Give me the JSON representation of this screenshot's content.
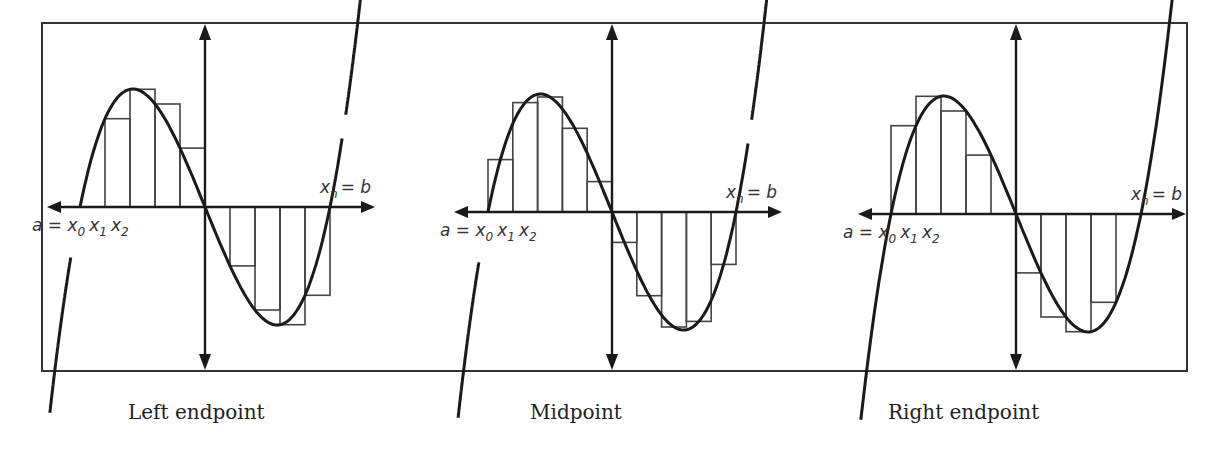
{
  "figure": {
    "panels": [
      {
        "id": "left",
        "caption": "Left endpoint",
        "method": "left",
        "origin": {
          "x": 205,
          "y": 207
        },
        "a_px": 80,
        "b_px": 332,
        "scale": {
          "sx": 84,
          "sy": 118
        },
        "label_a": "a = x",
        "label_x0_sub": "0",
        "label_x1": "x",
        "label_x1_sub": "1",
        "label_x2": "x",
        "label_x2_sub": "2",
        "label_b": "x",
        "label_b_sub": "n",
        "label_b_tail": "= b"
      },
      {
        "id": "mid",
        "caption": "Midpoint",
        "method": "mid",
        "origin": {
          "x": 612,
          "y": 212
        },
        "a_px": 488,
        "b_px": 738,
        "scale": {
          "sx": 83,
          "sy": 118
        },
        "label_a": "a = x",
        "label_x0_sub": "0",
        "label_x1": "x",
        "label_x1_sub": "1",
        "label_x2": "x",
        "label_x2_sub": "2",
        "label_b": "x",
        "label_b_sub": "n",
        "label_b_tail": "= b"
      },
      {
        "id": "right",
        "caption": "Right endpoint",
        "method": "right",
        "origin": {
          "x": 1016,
          "y": 214
        },
        "a_px": 891,
        "b_px": 1143,
        "scale": {
          "sx": 84,
          "sy": 118
        },
        "label_a": "a = x",
        "label_x0_sub": "0",
        "label_x1": "x",
        "label_x1_sub": "1",
        "label_x2": "x",
        "label_x2_sub": "2",
        "label_b": "x",
        "label_b_sub": "n",
        "label_b_tail": "= b"
      }
    ],
    "subintervals": 10,
    "function": "f(x) = x^3 - 3x (scaled; roots at -sqrt3, 0, sqrt3)",
    "colors": {
      "curve": "#1a1a1a",
      "axis": "#1a1a1a",
      "rect": "#444444",
      "frame": "#333333",
      "text": "#333333"
    }
  },
  "captions": {
    "left": "Left endpoint",
    "mid": "Midpoint",
    "right": "Right endpoint"
  }
}
